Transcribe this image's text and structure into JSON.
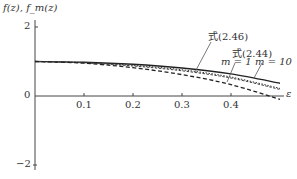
{
  "chart_data": {
    "type": "line",
    "title": "",
    "ylabel": "f(z), f_m(z)",
    "xlabel": "ε",
    "xlim": [
      0,
      0.5
    ],
    "ylim": [
      -2,
      2
    ],
    "xticks": [
      "0.1",
      "0.2",
      "0.3",
      "0.4"
    ],
    "yticks": [
      "2",
      "0",
      "−2"
    ],
    "grid": false,
    "x": [
      0,
      0.1,
      0.2,
      0.3,
      0.4,
      0.5
    ],
    "series": [
      {
        "name": "式(2.46)",
        "style": "solid",
        "values": [
          1.0,
          0.98,
          0.92,
          0.81,
          0.64,
          0.37
        ]
      },
      {
        "name": "式(2.44) m=10",
        "style": "dotted",
        "values": [
          1.0,
          0.97,
          0.89,
          0.76,
          0.55,
          0.22
        ]
      },
      {
        "name": "式(2.44) m=1",
        "style": "fine-dashed",
        "values": [
          1.0,
          0.96,
          0.87,
          0.73,
          0.52,
          0.19
        ]
      },
      {
        "name": "dashed",
        "style": "dashed",
        "values": [
          1.0,
          0.95,
          0.82,
          0.62,
          0.33,
          -0.1
        ]
      }
    ],
    "annotations": [
      "式(2.46)",
      "式(2.44)",
      "m = 1",
      "m = 10"
    ]
  },
  "labels": {
    "ylabel": "f(z), f_m(z)",
    "xlabel": "ε",
    "y2": "2",
    "y0": "0",
    "yneg2": "−2",
    "x1": "0.1",
    "x2": "0.2",
    "x3": "0.3",
    "x4": "0.4",
    "ann_246": "式(2.46)",
    "ann_244": "式(2.44)",
    "ann_m1": "m = 1",
    "ann_m10": "m = 10"
  }
}
